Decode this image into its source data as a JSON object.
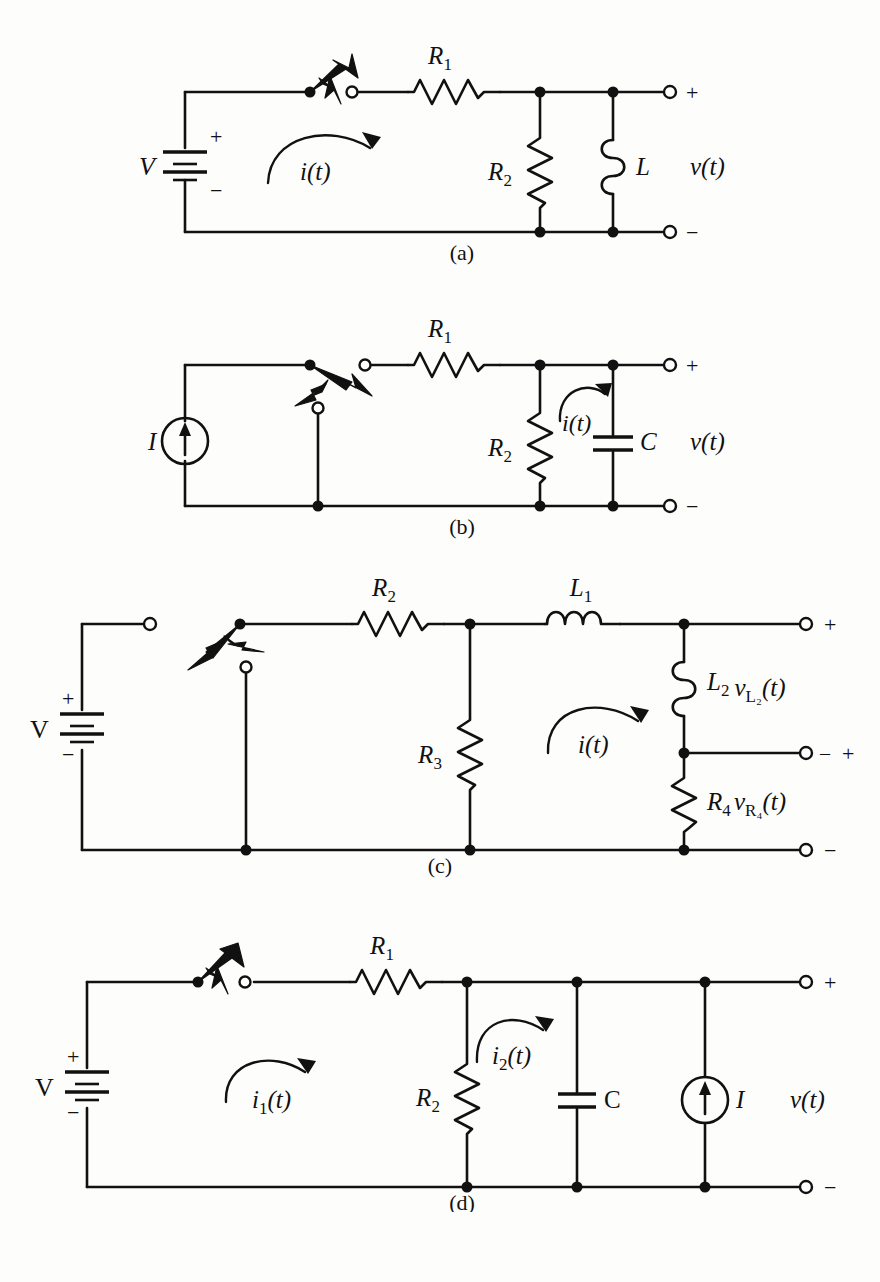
{
  "figure": {
    "kind": "electrical-circuit-schematic-set",
    "panel_count": 4,
    "symbols": {
      "resistor": "resistor-zigzag",
      "inductor": "inductor-coil",
      "capacitor": "capacitor-parallel-plates",
      "battery": "dc-voltage-source-battery",
      "current_source": "current-source-circle-arrow",
      "switch": "time-varying-switch-arrow",
      "terminal": "open-circle-terminal",
      "node": "filled-junction-dot",
      "loop_arrow": "curved-mesh-current-arrow"
    }
  },
  "panels": [
    {
      "id": "a",
      "caption": "(a)",
      "source_label": "V",
      "source_plus": "+",
      "source_minus": "−",
      "switch_label": "",
      "series_resistor": {
        "name": "R",
        "sub": "1"
      },
      "shunt_resistor": {
        "name": "R",
        "sub": "2"
      },
      "inductor": {
        "name": "L",
        "sub": ""
      },
      "loop_current": {
        "name": "i",
        "sub": "",
        "arg": "(t)"
      },
      "output_label": {
        "name": "v",
        "sub": "",
        "arg": "(t)"
      },
      "out_plus": "+",
      "out_minus": "−"
    },
    {
      "id": "b",
      "caption": "(b)",
      "source_label": "I",
      "series_resistor": {
        "name": "R",
        "sub": "1"
      },
      "shunt_resistor": {
        "name": "R",
        "sub": "2"
      },
      "capacitor": {
        "name": "C",
        "sub": ""
      },
      "loop_current": {
        "name": "i",
        "sub": "",
        "arg": "(t)"
      },
      "output_label": {
        "name": "v",
        "sub": "",
        "arg": "(t)"
      },
      "out_plus": "+",
      "out_minus": "−"
    },
    {
      "id": "c",
      "caption": "(c)",
      "source_label": "V",
      "source_plus": "+",
      "source_minus": "−",
      "series_resistor": {
        "name": "R",
        "sub": "2"
      },
      "shunt_resistor": {
        "name": "R",
        "sub": "3"
      },
      "series_inductor": {
        "name": "L",
        "sub": "1"
      },
      "branch_inductor": {
        "name": "L",
        "sub": "2"
      },
      "branch_resistor": {
        "name": "R",
        "sub": "4"
      },
      "loop_current": {
        "name": "i",
        "sub": "",
        "arg": "(t)"
      },
      "output_label_1": {
        "name": "v",
        "sub": "L₂",
        "arg": "(t)"
      },
      "output_label_2": {
        "name": "v",
        "sub": "R₄",
        "arg": "(t)"
      },
      "out_plus_top": "+",
      "out_mid_minus": "–",
      "out_mid_plus": "+",
      "out_minus_bottom": "−"
    },
    {
      "id": "d",
      "caption": "(d)",
      "source_label": "V",
      "source_plus": "+",
      "source_minus": "−",
      "series_resistor": {
        "name": "R",
        "sub": "1"
      },
      "shunt_resistor": {
        "name": "R",
        "sub": "2"
      },
      "capacitor": {
        "name": "C",
        "sub": ""
      },
      "current_source": {
        "name": "I",
        "sub": ""
      },
      "loop_current_1": {
        "name": "i",
        "sub": "1",
        "arg": "(t)"
      },
      "loop_current_2": {
        "name": "i",
        "sub": "2",
        "arg": "(t)"
      },
      "output_label": {
        "name": "v",
        "sub": "",
        "arg": "(t)"
      },
      "out_plus": "+",
      "out_minus": "−"
    }
  ],
  "colors": {
    "ink": "#111111",
    "paper": "#fdfdfc"
  }
}
